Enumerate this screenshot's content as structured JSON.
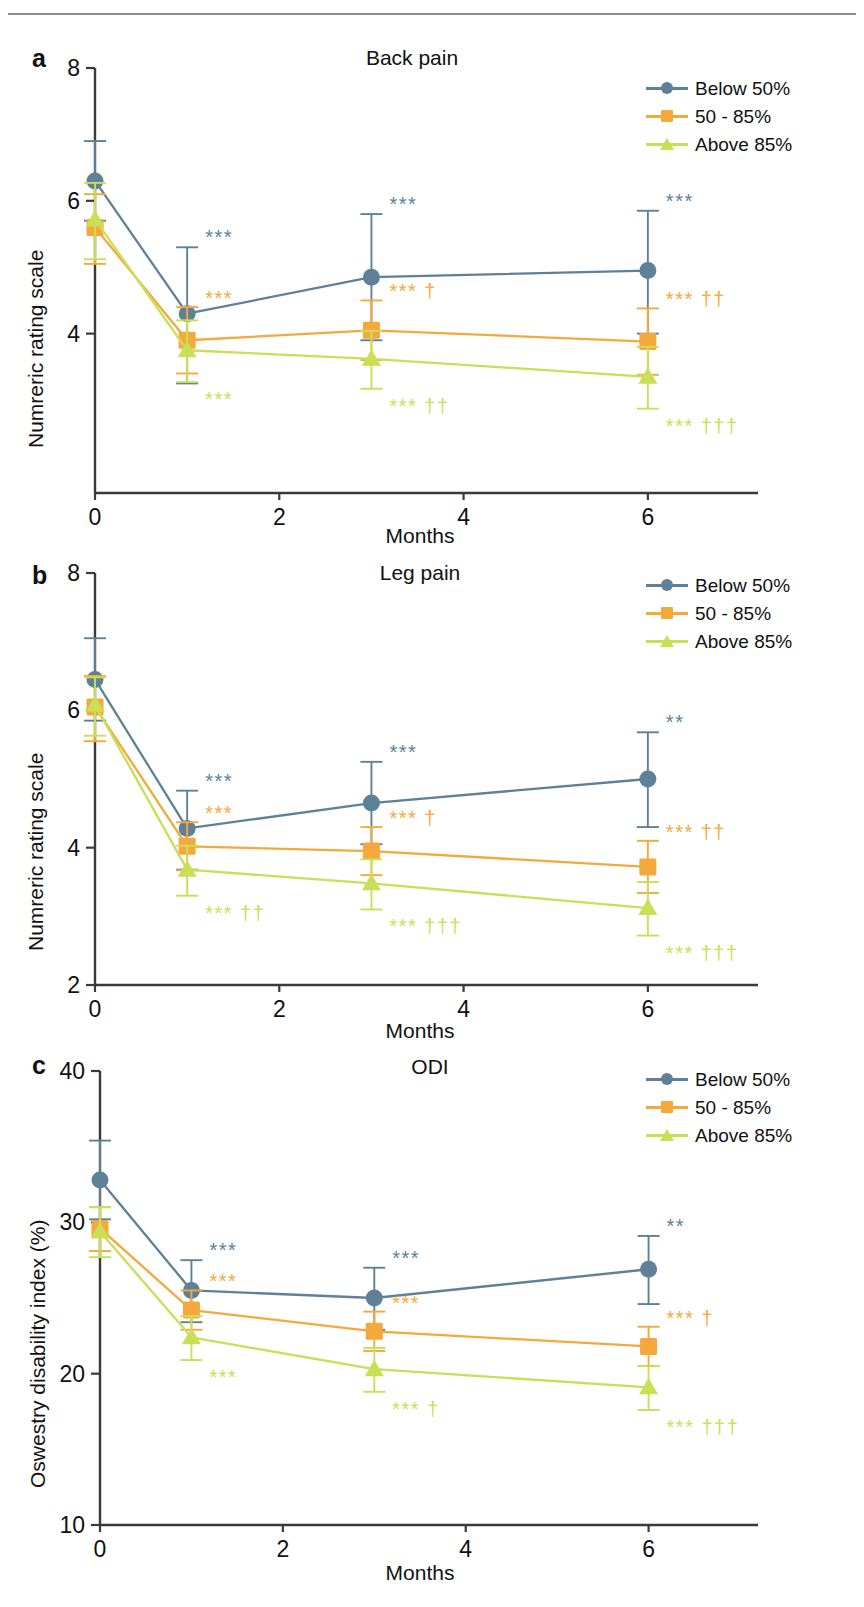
{
  "figure": {
    "width": 864,
    "height": 1607,
    "divider": "horizontal-rule"
  },
  "colors": {
    "below50": "#5e8198",
    "mid5085": "#f5a93c",
    "above85": "#c9df55",
    "axis": "#3a3a3a",
    "text": "#111111"
  },
  "legend": {
    "items": [
      {
        "label": "Below 50%",
        "marker": "circle",
        "color": "#5e8198"
      },
      {
        "label": "50 - 85%",
        "marker": "square",
        "color": "#f5a93c"
      },
      {
        "label": "Above 85%",
        "marker": "triangle",
        "color": "#c9df55"
      }
    ]
  },
  "chart_data": [
    {
      "panel": "a",
      "type": "line",
      "title": "Back pain",
      "xlabel": "Months",
      "ylabel": "Numreric rating scale",
      "x": [
        0,
        1,
        3,
        6
      ],
      "xticks": [
        0,
        2,
        4,
        6
      ],
      "xlim": [
        0,
        7
      ],
      "yticks": [
        8
      ],
      "ytick_labels": [
        "8",
        "6",
        "4"
      ],
      "ylabels_shown": [
        8,
        6,
        4
      ],
      "ylim": [
        1.6,
        8
      ],
      "minor_ticks_y": [
        7,
        6,
        5,
        4,
        3,
        2
      ],
      "series": [
        {
          "name": "Below 50%",
          "color": "#5e8198",
          "marker": "circle",
          "values": [
            6.3,
            4.3,
            4.85,
            4.95
          ],
          "err_low": [
            0.6,
            1.05,
            0.95,
            0.95
          ],
          "err_high": [
            0.6,
            1.0,
            0.95,
            0.9
          ],
          "sig": [
            "",
            "***",
            "***",
            "***"
          ]
        },
        {
          "name": "50 - 85%",
          "color": "#f5a93c",
          "marker": "square",
          "values": [
            5.6,
            3.9,
            4.05,
            3.88
          ],
          "err_low": [
            0.55,
            0.5,
            0.45,
            0.5
          ],
          "err_high": [
            0.5,
            0.5,
            0.45,
            0.5
          ],
          "sig": [
            "",
            "***",
            "*** †",
            "*** ††"
          ]
        },
        {
          "name": "Above 85%",
          "color": "#c9df55",
          "marker": "triangle",
          "values": [
            5.72,
            3.75,
            3.62,
            3.35
          ],
          "err_low": [
            0.6,
            0.48,
            0.45,
            0.48
          ],
          "err_high": [
            0.55,
            0.45,
            0.42,
            0.45
          ],
          "sig": [
            "",
            "***",
            "*** ††",
            "*** †††"
          ]
        }
      ]
    },
    {
      "panel": "b",
      "type": "line",
      "title": "Leg pain",
      "xlabel": "Months",
      "ylabel": "Numreric rating scale",
      "x": [
        0,
        1,
        3,
        6
      ],
      "xticks": [
        0,
        2,
        4,
        6
      ],
      "xlim": [
        0,
        7
      ],
      "ytick_labels": [
        "8",
        "6",
        "4",
        "2"
      ],
      "ylabels_shown": [
        8,
        6,
        4,
        2
      ],
      "ylim": [
        2,
        8
      ],
      "series": [
        {
          "name": "Below 50%",
          "color": "#5e8198",
          "marker": "circle",
          "values": [
            6.45,
            4.28,
            4.65,
            5.0
          ],
          "err_low": [
            0.6,
            0.6,
            0.6,
            0.7
          ],
          "err_high": [
            0.6,
            0.55,
            0.6,
            0.68
          ],
          "sig": [
            "",
            "***",
            "***",
            "**"
          ]
        },
        {
          "name": "50 - 85%",
          "color": "#f5a93c",
          "marker": "square",
          "values": [
            6.05,
            4.02,
            3.95,
            3.72
          ],
          "err_low": [
            0.5,
            0.35,
            0.35,
            0.38
          ],
          "err_high": [
            0.45,
            0.35,
            0.35,
            0.38
          ],
          "sig": [
            "",
            "***",
            "*** †",
            "*** ††"
          ]
        },
        {
          "name": "Above 85%",
          "color": "#c9df55",
          "marker": "triangle",
          "values": [
            6.08,
            3.68,
            3.48,
            3.12
          ],
          "err_low": [
            0.45,
            0.38,
            0.38,
            0.4
          ],
          "err_high": [
            0.4,
            0.35,
            0.35,
            0.38
          ],
          "sig": [
            "",
            "*** ††",
            "*** †††",
            "*** †††"
          ]
        }
      ]
    },
    {
      "panel": "c",
      "type": "line",
      "title": "ODI",
      "xlabel": "Months",
      "ylabel": "Oswestry disability index (%)",
      "x": [
        0,
        1,
        3,
        6
      ],
      "xticks": [
        0,
        2,
        4,
        6
      ],
      "xlim": [
        0,
        7
      ],
      "ytick_labels": [
        "40",
        "30",
        "20",
        "10"
      ],
      "ylabels_shown": [
        40,
        30,
        20,
        10
      ],
      "ylim": [
        10,
        40
      ],
      "series": [
        {
          "name": "Below 50%",
          "color": "#5e8198",
          "marker": "circle",
          "values": [
            32.8,
            25.5,
            25.0,
            26.9
          ],
          "err_low": [
            2.6,
            2.1,
            2.1,
            2.3
          ],
          "err_high": [
            2.6,
            2.0,
            2.0,
            2.2
          ],
          "sig": [
            "",
            "***",
            "***",
            "**"
          ]
        },
        {
          "name": "50 - 85%",
          "color": "#f5a93c",
          "marker": "square",
          "values": [
            29.6,
            24.2,
            22.8,
            21.8
          ],
          "err_low": [
            1.5,
            1.3,
            1.3,
            1.3
          ],
          "err_high": [
            1.4,
            1.3,
            1.3,
            1.3
          ],
          "sig": [
            "",
            "***",
            "***",
            "*** †"
          ]
        },
        {
          "name": "Above 85%",
          "color": "#c9df55",
          "marker": "triangle",
          "values": [
            29.4,
            22.4,
            20.3,
            19.1
          ],
          "err_low": [
            1.7,
            1.5,
            1.5,
            1.5
          ],
          "err_high": [
            1.6,
            1.4,
            1.4,
            1.4
          ],
          "sig": [
            "",
            "***",
            "*** †",
            "*** †††"
          ]
        }
      ]
    }
  ],
  "panels": {
    "a": {
      "letter": "a"
    },
    "b": {
      "letter": "b"
    },
    "c": {
      "letter": "c"
    }
  }
}
